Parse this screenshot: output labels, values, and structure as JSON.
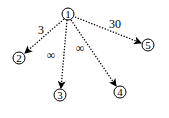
{
  "diagram": {
    "type": "directed-graph",
    "edge_style": "dotted",
    "nodes": [
      {
        "id": "1",
        "label": "1",
        "x": 68,
        "y": 14
      },
      {
        "id": "2",
        "label": "2",
        "x": 19,
        "y": 58
      },
      {
        "id": "3",
        "label": "3",
        "x": 60,
        "y": 95
      },
      {
        "id": "4",
        "label": "4",
        "x": 120,
        "y": 92
      },
      {
        "id": "5",
        "label": "5",
        "x": 148,
        "y": 45
      }
    ],
    "edges": [
      {
        "from": "1",
        "to": "2",
        "label": "3",
        "label_x": 41,
        "label_y": 30
      },
      {
        "from": "1",
        "to": "3",
        "label": "∞",
        "label_x": 51,
        "label_y": 55
      },
      {
        "from": "1",
        "to": "4",
        "label": "∞",
        "label_x": 80,
        "label_y": 48
      },
      {
        "from": "1",
        "to": "5",
        "label": "30",
        "label_x": 115,
        "label_y": 24
      }
    ]
  }
}
